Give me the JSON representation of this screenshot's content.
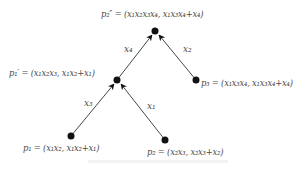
{
  "diagram": {
    "type": "tree",
    "nodes": {
      "p2pp": {
        "label": "p₂″ = (x₁x₂x₃x₄, x₁x₃x₄+x₄)"
      },
      "p1p": {
        "label": "p₁′ = (x₁x₂x₃, x₁x₂+x₁)"
      },
      "p3": {
        "label": "p₃ = (x₁x₃x₄, x₁x₃x₄+x₄)"
      },
      "p1": {
        "label": "p₁ = (x₁x₂, x₁x₂+x₁)"
      },
      "p2": {
        "label": "p₂ = (x₂x₃, x₂x₃+x₂)"
      }
    },
    "edges": [
      {
        "from": "p1",
        "to": "p1p",
        "label": "x₃"
      },
      {
        "from": "p2",
        "to": "p1p",
        "label": "x₁"
      },
      {
        "from": "p1p",
        "to": "p2pp",
        "label": "x₄"
      },
      {
        "from": "p3",
        "to": "p2pp",
        "label": "x₂"
      }
    ]
  }
}
